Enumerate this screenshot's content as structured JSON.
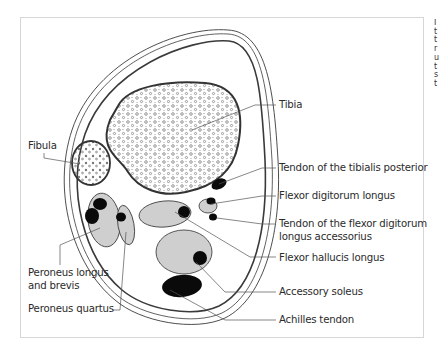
{
  "figure": {
    "labels": {
      "fibula": "Fibula",
      "tibia": "Tibia",
      "tendon_tibialis_posterior": "Tendon of the tibialis posterior",
      "flexor_digitorum_longus": "Flexor digitorum longus",
      "tendon_fdl_accessorius_line1": "Tendon of the flexor digitorum",
      "tendon_fdl_accessorius_line2": "longus accessorius",
      "flexor_hallucis_longus": "Flexor hallucis longus",
      "accessory_soleus": "Accessory soleus",
      "achilles_tendon": "Achilles tendon",
      "peroneus_longus_brevis_line1": "Peroneus longus",
      "peroneus_longus_brevis_line2": "and brevis",
      "peroneus_quartus": "Peroneus quartus"
    },
    "colors": {
      "outline": "#3a3a3a",
      "muscle_fill": "#cfcfcf",
      "tendon_fill": "#0a0a0a",
      "leader_line": "#555555",
      "frame_border": "#d6d6d6"
    }
  },
  "adjacent_column_clip": {
    "fragments": [
      "I",
      "t",
      "t",
      "r",
      "u",
      "t",
      "s",
      "t"
    ]
  }
}
